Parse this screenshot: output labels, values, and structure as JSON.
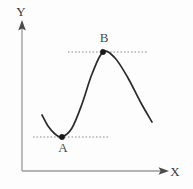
{
  "figure": {
    "background_color": "#fdfdfd",
    "curve_color": "#2b2b2b",
    "axis_color": "#9a9a9a",
    "guide_color": "#8d8d8d",
    "point_color": "#1a1a1a"
  },
  "axes": {
    "y_label": "Y",
    "x_label": "X",
    "origin": {
      "x": 22,
      "y": 171
    },
    "y_axis": {
      "x": 22,
      "y_bottom": 171,
      "y_top": 22
    },
    "x_axis": {
      "y": 171,
      "x_left": 22,
      "x_right": 168
    },
    "y_label_pos": {
      "x": 21,
      "y": 16
    },
    "x_label_pos": {
      "x": 175,
      "y": 176
    }
  },
  "chart_data": {
    "type": "line",
    "title": "",
    "xlabel": "X",
    "ylabel": "Y",
    "grid": false,
    "legend": null,
    "axis_ranges": {
      "xlim": [
        22,
        168
      ],
      "ylim": [
        22,
        171
      ]
    },
    "series": [
      {
        "name": "curve",
        "description": "smooth cubic-like curve with a local minimum then a local maximum",
        "points": [
          {
            "x": 42,
            "y": 115
          },
          {
            "x": 48,
            "y": 126
          },
          {
            "x": 55,
            "y": 134
          },
          {
            "x": 62,
            "y": 137
          },
          {
            "x": 72,
            "y": 128
          },
          {
            "x": 82,
            "y": 104
          },
          {
            "x": 92,
            "y": 74
          },
          {
            "x": 103,
            "y": 52
          },
          {
            "x": 115,
            "y": 58
          },
          {
            "x": 128,
            "y": 78
          },
          {
            "x": 141,
            "y": 103
          },
          {
            "x": 152,
            "y": 122
          }
        ]
      }
    ],
    "annotations": [
      {
        "label": "A",
        "role": "local-minimum",
        "point": {
          "x": 62,
          "y": 137
        },
        "label_pos": {
          "x": 63,
          "y": 152
        },
        "guide_line": {
          "x1": 33,
          "x2": 110,
          "y": 137,
          "style": "dashed"
        }
      },
      {
        "label": "B",
        "role": "local-maximum",
        "point": {
          "x": 103,
          "y": 52
        },
        "label_pos": {
          "x": 104,
          "y": 42
        },
        "guide_line": {
          "x1": 68,
          "x2": 148,
          "y": 52,
          "style": "dashed"
        }
      }
    ]
  }
}
